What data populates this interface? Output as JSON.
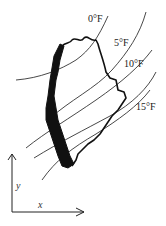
{
  "diagram": {
    "title": "",
    "isotherms": [
      {
        "label": "0°F"
      },
      {
        "label": "5°F"
      },
      {
        "label": "10°F"
      },
      {
        "label": "15°F"
      }
    ],
    "axes": {
      "y_label": "y",
      "x_label": "x"
    },
    "colors": {
      "ink": "#111111",
      "background": "#ffffff"
    }
  }
}
